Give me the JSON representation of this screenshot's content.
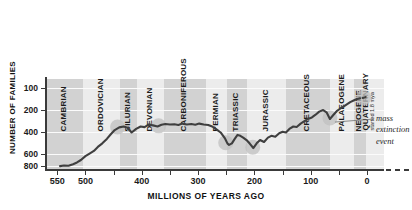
{
  "title_sliver": "LIFE  EVER  ONWARDS",
  "chart_data": {
    "type": "line",
    "title": "",
    "xlabel": "MILLIONS OF YEARS AGO",
    "ylabel": "NUMBER OF FAMILIES",
    "xlim": [
      570,
      -30
    ],
    "ylim": [
      60,
      880
    ],
    "grid": true,
    "legend": null,
    "xticks": [
      550,
      500,
      400,
      300,
      200,
      100,
      0
    ],
    "yticks": [
      100,
      200,
      400,
      600,
      800
    ],
    "x_tick_labels": [
      "550",
      "500",
      "400",
      "300",
      "200",
      "100",
      "0"
    ],
    "y_tick_labels": [
      "800",
      "600",
      "400",
      "200",
      "100"
    ],
    "series": [
      {
        "name": "Number of marine and continental families",
        "color": "#3f3f3f",
        "x": [
          545,
          538,
          530,
          522,
          515,
          508,
          500,
          492,
          485,
          478,
          470,
          462,
          455,
          448,
          440,
          432,
          425,
          418,
          410,
          402,
          395,
          388,
          380,
          372,
          365,
          358,
          350,
          342,
          335,
          328,
          320,
          312,
          305,
          298,
          290,
          282,
          275,
          268,
          260,
          252,
          248,
          245,
          240,
          235,
          230,
          225,
          220,
          214,
          208,
          202,
          196,
          190,
          183,
          176,
          170,
          163,
          156,
          150,
          144,
          138,
          131,
          125,
          118,
          112,
          105,
          98,
          92,
          85,
          78,
          72,
          66,
          60,
          54,
          48,
          42,
          36,
          30,
          24,
          18,
          12,
          6,
          2
        ],
        "y": [
          95,
          100,
          98,
          112,
          128,
          150,
          185,
          210,
          232,
          268,
          300,
          340,
          382,
          420,
          444,
          452,
          440,
          398,
          430,
          452,
          446,
          468,
          462,
          452,
          468,
          474,
          470,
          472,
          466,
          478,
          470,
          474,
          468,
          478,
          470,
          466,
          452,
          428,
          398,
          342,
          300,
          286,
          300,
          340,
          376,
          368,
          352,
          330,
          296,
          258,
          300,
          330,
          312,
          352,
          368,
          360,
          392,
          404,
          398,
          430,
          452,
          448,
          478,
          498,
          520,
          534,
          556,
          586,
          600,
          580,
          520,
          556,
          590,
          612,
          632,
          652,
          672,
          686,
          700,
          706,
          712,
          718
        ]
      }
    ],
    "end_dashed_segment": {
      "from_x": 18,
      "to_x": 2,
      "note": "dashed continuation at present day"
    },
    "extinction_markers": [
      {
        "label": "end-Ordovician",
        "x": 443,
        "y": 448
      },
      {
        "label": "late Devonian",
        "x": 370,
        "y": 458
      },
      {
        "label": "end-Permian",
        "x": 251,
        "y": 305
      },
      {
        "label": "end-Triassic",
        "x": 203,
        "y": 266
      },
      {
        "label": "end-Cretaceous",
        "x": 66,
        "y": 528
      },
      {
        "label": "present / human impact",
        "x": 6,
        "y": 712
      }
    ],
    "periods": [
      {
        "name": "CAMBRIAN",
        "start": 570,
        "end": 505,
        "shade": "dark"
      },
      {
        "name": "ORDOVICIAN",
        "start": 505,
        "end": 438,
        "shade": "light"
      },
      {
        "name": "SILURIAN",
        "start": 438,
        "end": 408,
        "shade": "dark"
      },
      {
        "name": "DEVONIAN",
        "start": 408,
        "end": 360,
        "shade": "light"
      },
      {
        "name": "CARBONIFEROUS",
        "start": 360,
        "end": 286,
        "shade": "dark"
      },
      {
        "name": "PERMIAN",
        "start": 286,
        "end": 248,
        "shade": "light"
      },
      {
        "name": "TRIASSIC",
        "start": 248,
        "end": 213,
        "shade": "dark"
      },
      {
        "name": "JURASSIC",
        "start": 213,
        "end": 144,
        "shade": "light"
      },
      {
        "name": "CRETACEOUS",
        "start": 144,
        "end": 65,
        "shade": "dark"
      },
      {
        "name": "PALAEOGENE",
        "start": 65,
        "end": 23,
        "shade": "light"
      },
      {
        "name": "NEOGENE",
        "start": 23,
        "end": 1.8,
        "shade": "dark"
      },
      {
        "name": "QUATERNARY",
        "sub": "started 1.8 mya",
        "start": 1.8,
        "end": -30,
        "shade": "light"
      }
    ],
    "annotation": {
      "line1": "mass",
      "line2": "extinction",
      "line3": "event"
    },
    "colors": {
      "line": "#3f3f3f",
      "band_dark": "#d2d2d2",
      "band_light": "#ececec",
      "marker": "#c0c0c0",
      "axis": "#3a3a3a",
      "grid": "#fbfbfb",
      "text": "#1b1b1b"
    }
  }
}
